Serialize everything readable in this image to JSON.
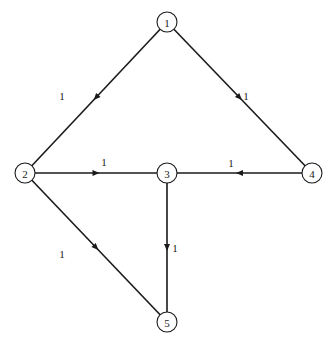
{
  "graph": {
    "nodes": [
      {
        "id": "1",
        "label": "1",
        "x": 167,
        "y": 22
      },
      {
        "id": "2",
        "label": "2",
        "x": 25,
        "y": 173
      },
      {
        "id": "3",
        "label": "3",
        "x": 167,
        "y": 173
      },
      {
        "id": "4",
        "label": "4",
        "x": 312,
        "y": 173
      },
      {
        "id": "5",
        "label": "5",
        "x": 167,
        "y": 322
      }
    ],
    "edges": [
      {
        "from": "1",
        "to": "2",
        "weight": "1",
        "label_x": 62,
        "label_y": 96
      },
      {
        "from": "1",
        "to": "4",
        "weight": "1",
        "label_x": 246,
        "label_y": 96
      },
      {
        "from": "2",
        "to": "3",
        "weight": "1",
        "label_x": 104,
        "label_y": 162
      },
      {
        "from": "4",
        "to": "3",
        "weight": "1",
        "label_x": 231,
        "label_y": 163
      },
      {
        "from": "3",
        "to": "5",
        "weight": "1",
        "label_x": 175,
        "label_y": 248
      },
      {
        "from": "2",
        "to": "5",
        "weight": "1",
        "label_x": 62,
        "label_y": 254
      }
    ]
  }
}
